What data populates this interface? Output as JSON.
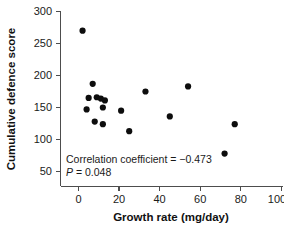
{
  "chart_data": {
    "type": "scatter",
    "title": "",
    "xlabel": "Growth rate (mg/day)",
    "ylabel": "Cumulative defence score",
    "xlim": [
      -10,
      100
    ],
    "ylim": [
      50,
      300
    ],
    "xticks": [
      0,
      20,
      40,
      60,
      80,
      100
    ],
    "yticks": [
      50,
      100,
      150,
      200,
      250,
      300
    ],
    "xtick_labels": [
      "0",
      "20",
      "40",
      "60",
      "80",
      "100"
    ],
    "ytick_labels": [
      "50",
      "100",
      "150",
      "200",
      "250",
      "300"
    ],
    "grid": false,
    "legend": null,
    "marker": "filled-circle",
    "marker_color": "#0d0d0d",
    "points": [
      {
        "x": 2,
        "y": 270
      },
      {
        "x": 7,
        "y": 187
      },
      {
        "x": 5,
        "y": 165
      },
      {
        "x": 9,
        "y": 166
      },
      {
        "x": 11,
        "y": 164
      },
      {
        "x": 13,
        "y": 161
      },
      {
        "x": 4,
        "y": 147
      },
      {
        "x": 12,
        "y": 150
      },
      {
        "x": 8,
        "y": 128
      },
      {
        "x": 12,
        "y": 124
      },
      {
        "x": 21,
        "y": 145
      },
      {
        "x": 25,
        "y": 113
      },
      {
        "x": 33,
        "y": 175
      },
      {
        "x": 45,
        "y": 136
      },
      {
        "x": 54,
        "y": 183
      },
      {
        "x": 72,
        "y": 78
      },
      {
        "x": 77,
        "y": 124
      }
    ],
    "annotations": [
      {
        "name": "correlation-coefficient",
        "text": "Correlation coefficient = −0.473",
        "x": 6,
        "y": 101
      },
      {
        "name": "p-value",
        "text_italic": "P",
        "text": " = 0.048",
        "x": 6,
        "y": 90
      }
    ]
  },
  "axes": {
    "x_title": "Growth rate (mg/day)",
    "y_title": "Cumulative defence score"
  },
  "stats": {
    "correlation_label": "Correlation coefficient = −0.473",
    "p_symbol": "P",
    "p_text": " = 0.048"
  },
  "colors": {
    "marker": "#0d0d0d",
    "axis": "#4d4d4d",
    "text": "#1a1a1a",
    "background": "#ffffff"
  }
}
